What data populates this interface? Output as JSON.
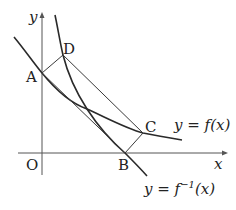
{
  "diagram": {
    "axes": {
      "x_label": "x",
      "y_label": "y",
      "origin_label": "O"
    },
    "points": {
      "A": "A",
      "B": "B",
      "C": "C",
      "D": "D"
    },
    "curves": {
      "f": "y = f(x)",
      "f_inverse_prefix": "y = f",
      "f_inverse_sup": "−1",
      "f_inverse_suffix": "(x)"
    },
    "colors": {
      "stroke": "#2a2a2a",
      "background": "#ffffff"
    }
  }
}
